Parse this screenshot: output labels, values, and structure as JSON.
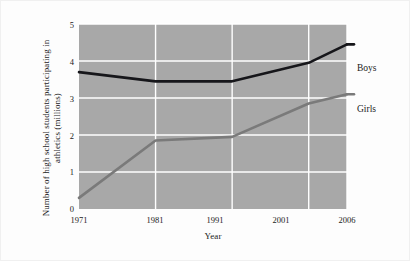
{
  "chart_data": {
    "type": "line",
    "title": "",
    "xlabel": "Year",
    "ylabel": "Number of high school students participating in athletics (millions)",
    "x": [
      1971,
      1981,
      1991,
      2001,
      2006
    ],
    "categories": [
      "1971",
      "1981",
      "1991",
      "2001",
      "2006"
    ],
    "xlim": [
      1971,
      2006
    ],
    "ylim": [
      0,
      5
    ],
    "yticks": [
      "0",
      "1",
      "2",
      "3",
      "4",
      "5"
    ],
    "ytick_values": [
      0,
      1,
      2,
      3,
      4,
      5
    ],
    "grid": true,
    "grid_color": "#ffffff",
    "plot_background": "#a8a8a8",
    "figure_background": "#fdfdfd",
    "legend_position": "right-inline",
    "series": [
      {
        "name": "Boys",
        "values": [
          3.7,
          3.45,
          3.45,
          3.95,
          4.45
        ],
        "color": "#16161a",
        "label_y": 4.05
      },
      {
        "name": "Girls",
        "values": [
          0.3,
          1.85,
          1.95,
          2.85,
          3.1
        ],
        "color": "#7a7a7a",
        "label_y": 2.95
      }
    ]
  },
  "axes": {
    "x_title": "Year",
    "y_title": "Number of high school students participating in athletics (millions)"
  },
  "ticks": {
    "y": [
      "5",
      "4",
      "3",
      "2",
      "1",
      "0"
    ],
    "x": [
      "1971",
      "1981",
      "1991",
      "2001",
      "2006"
    ]
  },
  "legend": {
    "boys_label": "Boys",
    "girls_label": "Girls"
  }
}
